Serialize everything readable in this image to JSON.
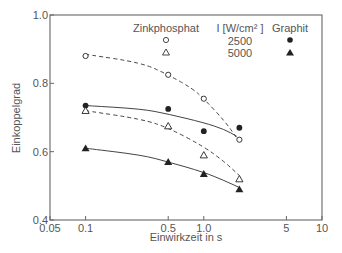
{
  "chart_data": {
    "type": "scatter",
    "title": "",
    "xlabel": "Einwirkzeit in s",
    "ylabel": "Einkoppelgrad",
    "xscale": "log",
    "xlim": [
      0.05,
      10
    ],
    "ylim": [
      0.4,
      1.0
    ],
    "xticks": [
      0.05,
      0.1,
      0.5,
      1.0,
      5,
      10
    ],
    "xtick_labels": [
      "0.05",
      "0.1",
      "0.5",
      "1.0",
      "5",
      "10"
    ],
    "yticks": [
      0.4,
      0.6,
      0.8,
      1.0
    ],
    "ytick_labels": [
      "0.4",
      "0.6",
      "0.8",
      "1.0"
    ],
    "grid": false,
    "legend": {
      "position": "top-right",
      "headers": [
        "Zinkphosphat",
        "I [W/cm² ]",
        "Graphit"
      ],
      "rows": [
        {
          "intensity": "2500",
          "zinkphosphat_marker": "open-circle",
          "graphit_marker": "filled-circle"
        },
        {
          "intensity": "5000",
          "zinkphosphat_marker": "open-triangle",
          "graphit_marker": "filled-triangle"
        }
      ]
    },
    "series": [
      {
        "name": "Zinkphosphat, 2500 W/cm²",
        "marker": "open-circle",
        "line": "dashed",
        "x": [
          0.1,
          0.5,
          1.0,
          2.0
        ],
        "y": [
          0.88,
          0.825,
          0.755,
          0.635
        ]
      },
      {
        "name": "Graphit, 2500 W/cm²",
        "marker": "filled-circle",
        "line": "solid",
        "x": [
          0.1,
          0.5,
          1.0,
          2.0
        ],
        "y": [
          0.735,
          0.725,
          0.66,
          0.67
        ]
      },
      {
        "name": "Zinkphosphat, 5000 W/cm²",
        "marker": "open-triangle",
        "line": "dashed",
        "x": [
          0.1,
          0.5,
          1.0,
          2.0
        ],
        "y": [
          0.72,
          0.675,
          0.59,
          0.52
        ]
      },
      {
        "name": "Graphit, 5000 W/cm²",
        "marker": "filled-triangle",
        "line": "solid",
        "x": [
          0.1,
          0.5,
          1.0,
          2.0
        ],
        "y": [
          0.61,
          0.57,
          0.535,
          0.49
        ]
      }
    ],
    "fit_curves": [
      {
        "style": "dashed",
        "x": [
          0.1,
          0.3,
          0.5,
          0.8,
          1.0,
          1.5,
          1.9
        ],
        "y": [
          0.885,
          0.86,
          0.825,
          0.785,
          0.755,
          0.69,
          0.64
        ]
      },
      {
        "style": "solid",
        "x": [
          0.1,
          0.3,
          0.5,
          1.0,
          1.5,
          1.9
        ],
        "y": [
          0.735,
          0.725,
          0.71,
          0.685,
          0.665,
          0.645
        ]
      },
      {
        "style": "dashed",
        "x": [
          0.1,
          0.3,
          0.5,
          1.0,
          1.5,
          2.0
        ],
        "y": [
          0.72,
          0.695,
          0.67,
          0.615,
          0.57,
          0.53
        ]
      },
      {
        "style": "solid",
        "x": [
          0.1,
          0.3,
          0.5,
          1.0,
          1.5,
          2.0
        ],
        "y": [
          0.61,
          0.59,
          0.57,
          0.54,
          0.515,
          0.495
        ]
      }
    ],
    "colors": {
      "axis": "#666666",
      "marker": "#222222",
      "line": "#444444",
      "text": "#555555"
    }
  }
}
